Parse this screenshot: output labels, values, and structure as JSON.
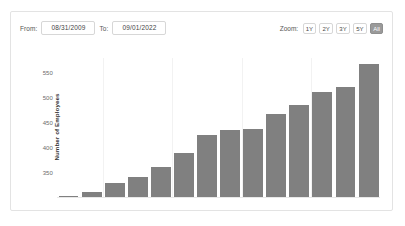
{
  "toolbar": {
    "from_label": "From:",
    "from_value": "08/31/2009",
    "to_label": "To:",
    "to_value": "09/01/2022",
    "zoom_label": "Zoom:",
    "zoom_options": [
      "1Y",
      "2Y",
      "3Y",
      "5Y",
      "All"
    ],
    "zoom_selected": "All"
  },
  "colors": {
    "bar": "#808080",
    "active_button": "#9a9a9a",
    "card_border": "#e3e3e3",
    "gridline": "#f2f2f2"
  },
  "chart_data": {
    "type": "bar",
    "title": "",
    "xlabel": "",
    "ylabel": "Number of Employees",
    "ylim": [
      300,
      580
    ],
    "yticks": [
      350,
      400,
      450,
      500,
      550
    ],
    "grid": "vertical",
    "legend": "none",
    "categories": [
      "1",
      "2",
      "3",
      "4",
      "5",
      "6",
      "7",
      "8",
      "9",
      "10",
      "11",
      "12",
      "13",
      "14"
    ],
    "values": [
      305,
      312,
      331,
      342,
      362,
      390,
      427,
      436,
      438,
      468,
      487,
      513,
      522,
      568
    ]
  }
}
